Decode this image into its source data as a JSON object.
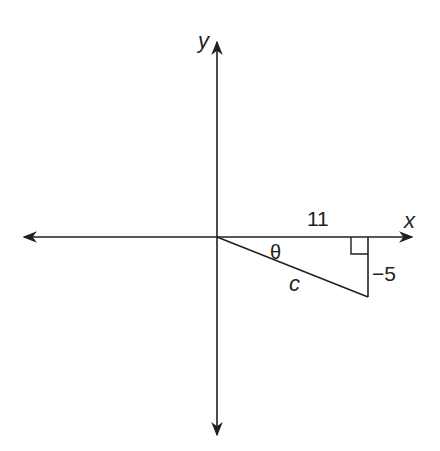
{
  "diagram": {
    "type": "right-triangle-on-coordinate-plane",
    "axes": {
      "x_label": "x",
      "y_label": "y"
    },
    "triangle": {
      "horizontal_leg_label": "11",
      "vertical_leg_label": "−5",
      "hypotenuse_label": "c",
      "angle_label": "θ",
      "right_angle_marker": true
    },
    "colors": {
      "line": "#231f20",
      "background": "#ffffff"
    }
  }
}
